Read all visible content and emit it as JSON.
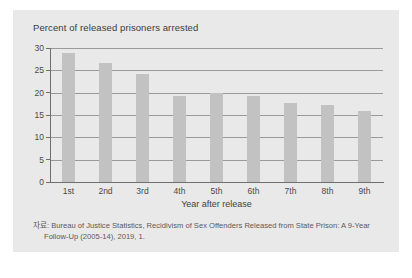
{
  "chart_data": {
    "type": "bar",
    "title": "Percent of released prisoners arrested",
    "xlabel": "Year after release",
    "ylabel": "",
    "categories": [
      "1st",
      "2nd",
      "3rd",
      "4th",
      "5th",
      "6th",
      "7th",
      "8th",
      "9th"
    ],
    "values": [
      28.9,
      26.6,
      24.2,
      19.3,
      20.0,
      19.3,
      17.8,
      17.3,
      16.0
    ],
    "ylim": [
      0,
      30
    ],
    "yticks": [
      0,
      5,
      10,
      15,
      20,
      25,
      30
    ],
    "ytick_labels": [
      "0",
      "5",
      "10",
      "15",
      "20",
      "25",
      "30"
    ],
    "grid": true,
    "legend": "none",
    "bar_color": "#c2c2c2",
    "panel_color": "#e9e9e9",
    "axis_color": "#6f6f6f",
    "gridline_color": "#9a9a9a"
  },
  "source": {
    "line1": "자료: Bureau of Justice Statistics, Recidivism of Sex Offenders Released from State Prison: A 9-Year",
    "line2": "Follow-Up (2005-14), 2019, 1."
  }
}
